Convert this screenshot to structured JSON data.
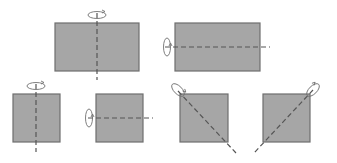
{
  "colors": {
    "fill": "#a6a6a6",
    "stroke": "#6e6e6e",
    "axis": "#555555",
    "arrow": "#707070",
    "background": "#ffffff"
  },
  "figures": [
    {
      "id": "rectangle-vertical-axis",
      "shape": "rectangle",
      "axis": "vertical",
      "x": 55,
      "y": 23,
      "w": 84,
      "h": 48,
      "axis_line": [
        97,
        13,
        97,
        80
      ],
      "arrow": {
        "cx": 97,
        "cy": 15,
        "rx": 9,
        "ry": 3.5,
        "orientation": "horizontal"
      }
    },
    {
      "id": "rectangle-horizontal-axis",
      "shape": "rectangle",
      "axis": "horizontal",
      "x": 175,
      "y": 23,
      "w": 85,
      "h": 48,
      "axis_line": [
        165,
        47,
        270,
        47
      ],
      "arrow": {
        "cx": 167,
        "cy": 47,
        "rx": 3.5,
        "ry": 9,
        "orientation": "vertical"
      }
    },
    {
      "id": "square-vertical-axis",
      "shape": "square",
      "axis": "vertical",
      "x": 13,
      "y": 94,
      "w": 47,
      "h": 48,
      "axis_line": [
        36,
        84,
        36,
        152
      ],
      "arrow": {
        "cx": 36,
        "cy": 86,
        "rx": 9,
        "ry": 3.5,
        "orientation": "horizontal"
      }
    },
    {
      "id": "square-horizontal-axis",
      "shape": "square",
      "axis": "horizontal",
      "x": 96,
      "y": 94,
      "w": 47,
      "h": 48,
      "axis_line": [
        88,
        118,
        153,
        118
      ],
      "arrow": {
        "cx": 89,
        "cy": 118,
        "rx": 3.5,
        "ry": 9,
        "orientation": "vertical"
      }
    },
    {
      "id": "square-diagonal-axis-left",
      "shape": "square",
      "axis": "diagonal",
      "x": 180,
      "y": 94,
      "w": 48,
      "h": 48,
      "axis_line": [
        178,
        91,
        236,
        153
      ],
      "arrow": {
        "cx": 178,
        "cy": 90,
        "rx": 8,
        "ry": 4,
        "orientation": "diagonal-left"
      }
    },
    {
      "id": "square-diagonal-axis-right",
      "shape": "square",
      "axis": "diagonal",
      "x": 263,
      "y": 94,
      "w": 47,
      "h": 48,
      "axis_line": [
        313,
        90,
        254,
        153
      ],
      "arrow": {
        "cx": 313,
        "cy": 90,
        "rx": 8,
        "ry": 4,
        "orientation": "diagonal-right"
      }
    }
  ]
}
